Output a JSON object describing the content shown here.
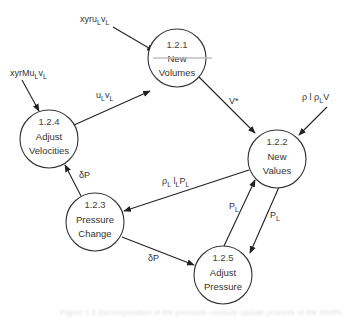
{
  "diagram": {
    "type": "data-flow-diagram",
    "nodes": [
      {
        "id": "1.2.1",
        "line1": "New",
        "line2": "Volumes",
        "cx": 177,
        "cy": 58
      },
      {
        "id": "1.2.2",
        "line1": "New",
        "line2": "Values",
        "cx": 277,
        "cy": 159
      },
      {
        "id": "1.2.3",
        "line1": "Pressure",
        "line2": "Change",
        "cx": 95,
        "cy": 222
      },
      {
        "id": "1.2.4",
        "line1": "Adjust",
        "line2": "Velocities",
        "cx": 49,
        "cy": 139
      },
      {
        "id": "1.2.5",
        "line1": "Adjust",
        "line2": "Pressure",
        "cx": 223,
        "cy": 275
      }
    ],
    "flows": [
      {
        "from": "external",
        "to": "1.2.1",
        "label_main": "xyru",
        "label_sub1": "L",
        "label_mid": "v",
        "label_sub2": "L"
      },
      {
        "from": "external",
        "to": "1.2.4",
        "label_main": "xyrMu",
        "label_sub1": "L",
        "label_mid": "v",
        "label_sub2": "L"
      },
      {
        "from": "external",
        "to": "1.2.2",
        "label_main": "ρ l ρ",
        "label_sub1": "L",
        "label_mid": "V",
        "label_sub2": ""
      },
      {
        "from": "1.2.4",
        "to": "1.2.1",
        "label_main": "u",
        "label_sub1": "L",
        "label_mid": "v",
        "label_sub2": "L"
      },
      {
        "from": "1.2.1",
        "to": "1.2.2",
        "label_main": "V*",
        "label_sub1": "",
        "label_mid": "",
        "label_sub2": ""
      },
      {
        "from": "1.2.2",
        "to": "1.2.3",
        "label_main": "ρ",
        "label_sub1": "L",
        "label_mid": " l",
        "label_sub2": "L",
        "label_tail": "P",
        "label_sub3": "L"
      },
      {
        "from": "1.2.3",
        "to": "1.2.4",
        "label_main": "δP",
        "label_sub1": "",
        "label_mid": "",
        "label_sub2": ""
      },
      {
        "from": "1.2.3",
        "to": "1.2.5",
        "label_main": "δP",
        "label_sub1": "",
        "label_mid": "",
        "label_sub2": ""
      },
      {
        "from": "1.2.5",
        "to": "1.2.2",
        "label_main": "P",
        "label_sub1": "L",
        "label_mid": "",
        "label_sub2": ""
      },
      {
        "from": "1.2.2",
        "to": "1.2.5",
        "label_main": "P",
        "label_sub1": "L",
        "label_mid": "",
        "label_sub2": ""
      }
    ]
  },
  "caption": {
    "text": "Figure 1.2  Decomposition of the pressure–velocity update process of the SIMPLE algorithm"
  }
}
